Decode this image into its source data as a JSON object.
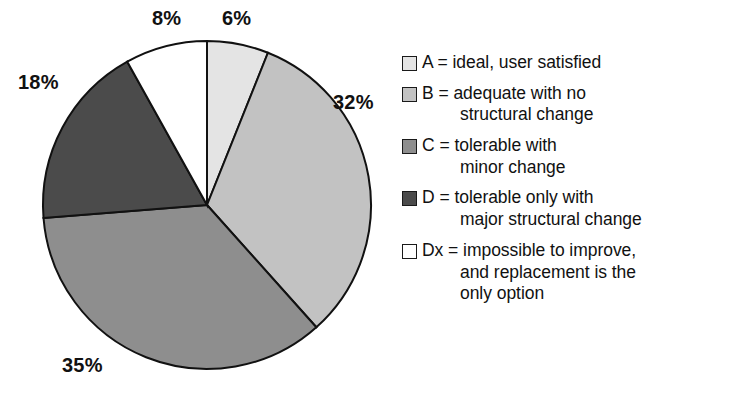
{
  "chart_data": {
    "type": "pie",
    "title": "",
    "start_angle_deg": 0,
    "direction": "clockwise",
    "legend_position": "right",
    "grid": false,
    "categories": [
      "A",
      "B",
      "C",
      "D",
      "Dx"
    ],
    "values": [
      6,
      32,
      35,
      18,
      8
    ],
    "value_labels": [
      "6%",
      "32%",
      "35%",
      "18%",
      "8%"
    ],
    "colors": [
      "#e4e4e4",
      "#c2c2c2",
      "#8e8e8e",
      "#4b4b4b",
      "#ffffff"
    ],
    "outline_color": "#111111",
    "slices": [
      {
        "key": "A",
        "label": "A",
        "value": 6,
        "value_label": "6%",
        "color": "#e4e4e4"
      },
      {
        "key": "B",
        "label": "B",
        "value": 32,
        "value_label": "32%",
        "color": "#c2c2c2"
      },
      {
        "key": "C",
        "label": "C",
        "value": 35,
        "value_label": "35%",
        "color": "#8e8e8e"
      },
      {
        "key": "D",
        "label": "D",
        "value": 18,
        "value_label": "18%",
        "color": "#4b4b4b"
      },
      {
        "key": "Dx",
        "label": "Dx",
        "value": 8,
        "value_label": "8%",
        "color": "#ffffff"
      }
    ],
    "legend_entries": [
      {
        "key": "A",
        "color": "#e4e4e4",
        "text": "A = ideal, user satisfied",
        "lines": [
          "A = ideal, user satisfied"
        ]
      },
      {
        "key": "B",
        "color": "#c2c2c2",
        "text": "B = adequate with no structural change",
        "lines": [
          "B = adequate with no",
          "structural change"
        ]
      },
      {
        "key": "C",
        "color": "#8e8e8e",
        "text": "C = tolerable with minor change",
        "lines": [
          "C = tolerable with",
          "minor change"
        ]
      },
      {
        "key": "D",
        "color": "#4b4b4b",
        "text": "D = tolerable only with major structural change",
        "lines": [
          "D = tolerable only with",
          "major structural change"
        ]
      },
      {
        "key": "Dx",
        "color": "#ffffff",
        "text": "Dx = impossible to improve, and replacement is the only option",
        "lines": [
          "Dx = impossible to improve,",
          "and replacement is the",
          "only option"
        ]
      }
    ]
  },
  "labels": {
    "pct_a": "6%",
    "pct_b": "32%",
    "pct_c": "35%",
    "pct_d": "18%",
    "pct_dx": "8%"
  },
  "legend": {
    "a_line1": "A = ideal, user satisfied",
    "b_line1": "B = adequate with no",
    "b_line2": "structural change",
    "c_line1": "C = tolerable with",
    "c_line2": "minor change",
    "d_line1": "D = tolerable only with",
    "d_line2": "major structural change",
    "dx_line1": "Dx = impossible to improve,",
    "dx_line2": "and replacement is the",
    "dx_line3": "only option"
  }
}
